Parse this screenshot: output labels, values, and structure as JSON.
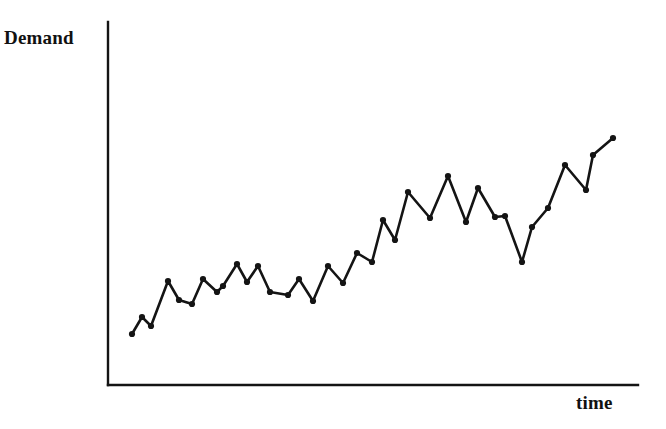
{
  "chart_data": {
    "type": "line",
    "title": "",
    "subtitle": "",
    "xlabel": "time",
    "ylabel": "Demand",
    "legend": [],
    "grid": false,
    "axis_ticks_visible": false,
    "tick_labels_x": [],
    "tick_labels_y": [],
    "xlim": [
      0,
      39
    ],
    "ylim": [
      0,
      100
    ],
    "markers": "filled-circle",
    "line_color": "#141414",
    "marker_color": "#141414",
    "axis_color": "#141414",
    "background_color": "#ffffff",
    "x": [
      1,
      2,
      3,
      4,
      5,
      6,
      7,
      8,
      9,
      10,
      11,
      12,
      13,
      14,
      15,
      16,
      17,
      18,
      19,
      20,
      21,
      22,
      23,
      24,
      25,
      26,
      27,
      28,
      29,
      30,
      31,
      32,
      33,
      34,
      35,
      36,
      37,
      38
    ],
    "series": [
      {
        "name": "Demand",
        "values": [
          14,
          22,
          18,
          36,
          28,
          22,
          41,
          33,
          32,
          44,
          36,
          44,
          32,
          34,
          28,
          40,
          30,
          43,
          37,
          47,
          42,
          57,
          48,
          67,
          58,
          73,
          55,
          66,
          57,
          52,
          42,
          60,
          66,
          73,
          84,
          75,
          88,
          93
        ]
      }
    ],
    "points_px": [
      [
        132,
        334
      ],
      [
        142,
        317
      ],
      [
        151,
        326
      ],
      [
        168,
        281
      ],
      [
        179,
        300
      ],
      [
        192,
        304
      ],
      [
        203,
        279
      ],
      [
        217,
        292
      ],
      [
        223,
        286
      ],
      [
        237,
        264
      ],
      [
        247,
        282
      ],
      [
        258,
        266
      ],
      [
        270,
        292
      ],
      [
        288,
        295
      ],
      [
        299,
        279
      ],
      [
        313,
        301
      ],
      [
        328,
        266
      ],
      [
        343,
        283
      ],
      [
        357,
        253
      ],
      [
        372,
        262
      ],
      [
        383,
        220
      ],
      [
        395,
        240
      ],
      [
        408,
        192
      ],
      [
        430,
        218
      ],
      [
        448,
        176
      ],
      [
        466,
        222
      ],
      [
        478,
        188
      ],
      [
        495,
        217
      ],
      [
        505,
        216
      ],
      [
        522,
        262
      ],
      [
        532,
        227
      ],
      [
        548,
        208
      ],
      [
        565,
        165
      ],
      [
        586,
        190
      ],
      [
        593,
        155
      ],
      [
        613,
        138
      ]
    ]
  },
  "axes": {
    "y_axis_label": "Demand",
    "x_axis_label": "time",
    "origin_px": [
      108,
      385
    ],
    "y_axis_top_px": 22,
    "x_axis_right_px": 638
  },
  "labels": {
    "demand": "Demand",
    "time": "time"
  }
}
